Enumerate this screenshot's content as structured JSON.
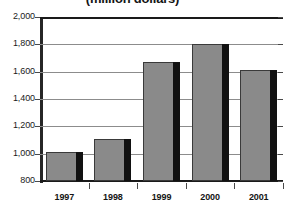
{
  "chart_data": {
    "type": "bar",
    "title": "(million dollars)",
    "xlabel": "",
    "ylabel": "",
    "categories": [
      "1997",
      "1998",
      "1999",
      "2000",
      "2001"
    ],
    "values": [
      1010,
      1105,
      1670,
      1800,
      1615
    ],
    "series": [
      {
        "name": "Value",
        "values": [
          1010,
          1105,
          1670,
          1800,
          1615
        ]
      }
    ],
    "ylim": [
      800,
      2000
    ],
    "y_ticks": [
      800,
      1000,
      1200,
      1400,
      1600,
      1800,
      2000
    ],
    "y_tick_labels": [
      "800",
      "1,000",
      "1,200",
      "1,400",
      "1,600",
      "1,800",
      "2,000"
    ],
    "grid": true,
    "legend": false,
    "colors": {
      "bar_face": "#8a8a8a",
      "bar_side": "#111111",
      "gridline": "#8c8c8c",
      "axis": "#262626",
      "text": "#141414"
    }
  }
}
